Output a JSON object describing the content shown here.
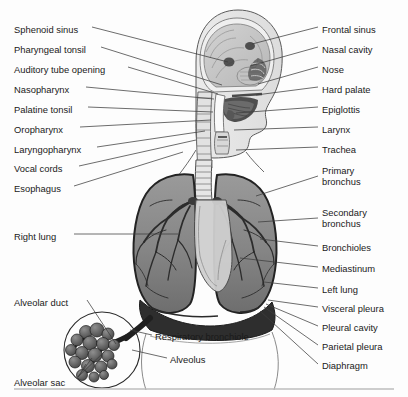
{
  "figure": {
    "background_color": "#fdfdfd",
    "line_color": "#3c3c3c",
    "text_color": "#1a1a1a",
    "bottom_rule": true
  },
  "labels_left": [
    {
      "text": "Sphenoid sinus",
      "x": 14,
      "y": 25,
      "lx": 92,
      "ly": 30,
      "tx": 228,
      "ty": 62
    },
    {
      "text": "Pharyngeal tonsil",
      "x": 14,
      "y": 45,
      "lx": 99,
      "ly": 50,
      "tx": 222,
      "ty": 85
    },
    {
      "text": "Auditory tube opening",
      "x": 14,
      "y": 65,
      "lx": 126,
      "ly": 70,
      "tx": 218,
      "ty": 94
    },
    {
      "text": "Nasopharynx",
      "x": 14,
      "y": 85,
      "lx": 84,
      "ly": 90,
      "tx": 214,
      "ty": 99
    },
    {
      "text": "Palatine tonsil",
      "x": 14,
      "y": 105,
      "lx": 86,
      "ly": 110,
      "tx": 213,
      "ty": 112
    },
    {
      "text": "Oropharynx",
      "x": 14,
      "y": 125,
      "lx": 78,
      "ly": 130,
      "tx": 211,
      "ty": 120
    },
    {
      "text": "Laryngopharynx",
      "x": 14,
      "y": 145,
      "lx": 95,
      "ly": 150,
      "tx": 205,
      "ty": 131
    },
    {
      "text": "Vocal cords",
      "x": 14,
      "y": 164,
      "lx": 77,
      "ly": 169,
      "tx": 196,
      "ty": 140
    },
    {
      "text": "Esophagus",
      "x": 14,
      "y": 184,
      "lx": 72,
      "ly": 189,
      "tx": 183,
      "ty": 152
    },
    {
      "text": "Right lung",
      "x": 14,
      "y": 232,
      "lx": 72,
      "ly": 237,
      "tx": 178,
      "ty": 237
    },
    {
      "text": "Alveolar duct",
      "x": 14,
      "y": 298,
      "lx": 85,
      "ly": 303,
      "tx": 112,
      "ly2": 303,
      "ty": 345
    },
    {
      "text": "Alveolar sac",
      "x": 14,
      "y": 378,
      "lx": 76,
      "ly": 375,
      "tx": 108,
      "ty": 352
    }
  ],
  "labels_right": [
    {
      "text": "Frontal sinus",
      "x": 322,
      "y": 25,
      "lx": 318,
      "ly": 30,
      "tx": 248,
      "ty": 44
    },
    {
      "text": "Nasal cavity",
      "x": 322,
      "y": 45,
      "lx": 318,
      "ly": 50,
      "tx": 244,
      "ty": 66
    },
    {
      "text": "Nose",
      "x": 322,
      "y": 65,
      "lx": 318,
      "ly": 70,
      "tx": 250,
      "ty": 84
    },
    {
      "text": "Hard palate",
      "x": 322,
      "y": 85,
      "lx": 318,
      "ly": 90,
      "tx": 240,
      "ty": 96
    },
    {
      "text": "Epiglottis",
      "x": 322,
      "y": 105,
      "lx": 318,
      "ly": 110,
      "tx": 232,
      "ty": 113
    },
    {
      "text": "Larynx",
      "x": 322,
      "y": 125,
      "lx": 318,
      "ly": 130,
      "tx": 233,
      "ty": 130
    },
    {
      "text": "Trachea",
      "x": 322,
      "y": 145,
      "lx": 318,
      "ly": 150,
      "tx": 234,
      "ty": 150
    },
    {
      "text": "Primary\nbronchus",
      "x": 322,
      "y": 166,
      "lx": 318,
      "ly": 178,
      "tx": 252,
      "ty": 196
    },
    {
      "text": "Secondary\nbronchus",
      "x": 322,
      "y": 208,
      "lx": 318,
      "ly": 220,
      "tx": 256,
      "ty": 222
    },
    {
      "text": "Bronchioles",
      "x": 322,
      "y": 243,
      "lx": 318,
      "ly": 248,
      "tx": 258,
      "ty": 239
    },
    {
      "text": "Mediastinum",
      "x": 322,
      "y": 264,
      "lx": 318,
      "ly": 269,
      "tx": 242,
      "ty": 258
    },
    {
      "text": "Left lung",
      "x": 322,
      "y": 285,
      "lx": 318,
      "ly": 290,
      "tx": 262,
      "ty": 282
    },
    {
      "text": "Visceral pleura",
      "x": 322,
      "y": 304,
      "lx": 318,
      "ly": 309,
      "tx": 266,
      "ty": 300
    },
    {
      "text": "Pleural cavity",
      "x": 322,
      "y": 323,
      "lx": 318,
      "ly": 328,
      "tx": 264,
      "ty": 303
    },
    {
      "text": "Parietal pleura",
      "x": 322,
      "y": 342,
      "lx": 318,
      "ly": 347,
      "tx": 262,
      "ty": 306
    },
    {
      "text": "Diaphragm",
      "x": 322,
      "y": 361,
      "lx": 318,
      "ly": 366,
      "tx": 258,
      "ty": 309
    }
  ],
  "labels_inset": [
    {
      "text": "Respiratory bronchiole",
      "x": 155,
      "y": 332,
      "lx": 152,
      "ly": 337,
      "tx": 128,
      "ty": 330
    },
    {
      "text": "Alveolus",
      "x": 170,
      "y": 355,
      "lx": 167,
      "ly": 360,
      "tx": 130,
      "ty": 350
    }
  ]
}
